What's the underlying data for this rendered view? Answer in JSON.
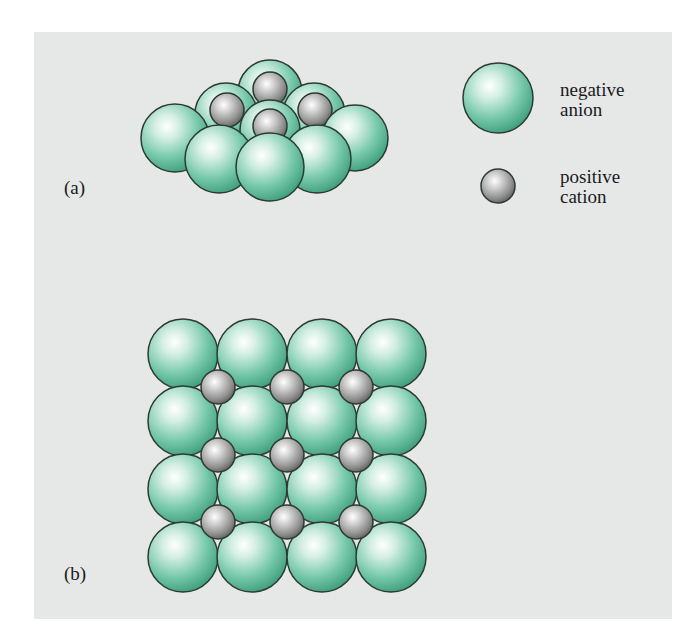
{
  "figure": {
    "panel_a_label": "(a)",
    "panel_b_label": "(b)",
    "legend": {
      "anion": {
        "line1": "negative",
        "line2": "anion",
        "color": "#5cbf9c"
      },
      "cation": {
        "line1": "positive",
        "line2": "cation",
        "color": "#9a9a9a"
      }
    },
    "colors": {
      "background": "#e6e8e8",
      "anion_fill": "#5cbf9c",
      "anion_highlight": "#ffffff",
      "cation_fill": "#8e8e8e",
      "outline": "#2e3a34"
    },
    "panel_b_grid": {
      "anion_rows": 4,
      "anion_cols": 4,
      "cation_rows": 3,
      "cation_cols": 3
    }
  }
}
